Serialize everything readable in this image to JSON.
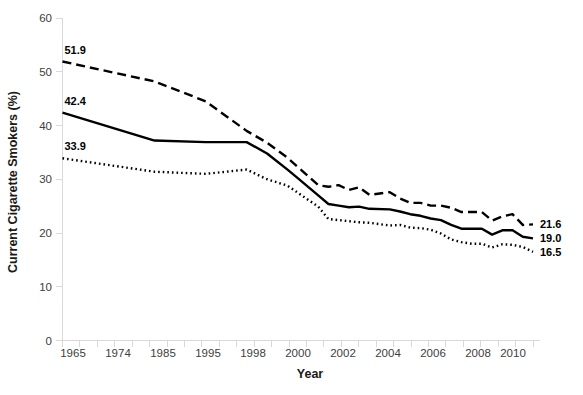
{
  "chart_data": {
    "type": "line",
    "title": "",
    "xlabel": "Year",
    "ylabel": "Current Cigarette Smokers (%)",
    "ylim": [
      0,
      60
    ],
    "yticks": [
      0,
      10,
      20,
      30,
      40,
      50,
      60
    ],
    "ytick_labels": [
      "0",
      "10",
      "20",
      "30",
      "40",
      "50",
      "60"
    ],
    "xlim": [
      1965,
      2011
    ],
    "xtick_labels": [
      "1965",
      "1974",
      "1985",
      "1995",
      "1998",
      "2000",
      "2002",
      "2004",
      "2006",
      "2008",
      "2010"
    ],
    "grid": false,
    "legend_position": "none",
    "x": [
      1965,
      1974,
      1979,
      1983,
      1985,
      1987,
      1988,
      1990,
      1991,
      1992,
      1993,
      1994,
      1995,
      1997,
      1998,
      1999,
      2000,
      2001,
      2002,
      2003,
      2004,
      2005,
      2006,
      2007,
      2008,
      2009,
      2010,
      2011
    ],
    "series": [
      {
        "name": "Male",
        "line_style": "dashed",
        "color": "#000000",
        "start_label": "51.9",
        "end_label": "21.6",
        "values": [
          51.9,
          48.2,
          44.5,
          39.0,
          36.8,
          34.0,
          32.3,
          28.9,
          28.6,
          28.9,
          28.0,
          28.5,
          27.1,
          27.6,
          26.4,
          25.6,
          25.6,
          25.1,
          25.1,
          24.7,
          23.9,
          23.9,
          23.9,
          22.3,
          23.1,
          23.5,
          21.5,
          21.6
        ]
      },
      {
        "name": "Overall",
        "line_style": "solid",
        "color": "#000000",
        "start_label": "42.4",
        "end_label": "19.0",
        "values": [
          42.4,
          37.2,
          36.9,
          36.9,
          34.8,
          31.8,
          30.2,
          27.0,
          25.4,
          25.1,
          24.8,
          24.9,
          24.5,
          24.4,
          24.0,
          23.5,
          23.2,
          22.7,
          22.4,
          21.5,
          20.8,
          20.8,
          20.8,
          19.7,
          20.5,
          20.5,
          19.3,
          19.0
        ]
      },
      {
        "name": "Female",
        "line_style": "dotted",
        "color": "#000000",
        "start_label": "33.9",
        "end_label": "16.5",
        "values": [
          33.9,
          31.4,
          31.0,
          31.8,
          30.0,
          28.8,
          27.5,
          24.9,
          22.6,
          22.4,
          22.2,
          22.0,
          21.9,
          21.4,
          21.5,
          21.0,
          20.9,
          20.6,
          19.9,
          18.8,
          18.3,
          18.0,
          18.0,
          17.3,
          17.9,
          17.8,
          17.4,
          16.5
        ]
      }
    ]
  },
  "labels": {
    "y_axis_title": "Current Cigarette Smokers (%)",
    "x_axis_title": "Year"
  }
}
